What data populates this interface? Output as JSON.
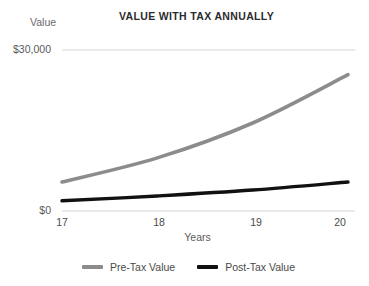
{
  "chart_data": {
    "type": "line",
    "title": "VALUE WITH TAX ANNUALLY",
    "xlabel": "Years",
    "ylabel": "Value",
    "x": [
      17,
      18,
      19,
      20
    ],
    "xtick_labels": [
      "17",
      "18",
      "19",
      "20"
    ],
    "ytick_labels": [
      "$0",
      "$30,000"
    ],
    "ylim": [
      0,
      30000
    ],
    "xlim": [
      17,
      20
    ],
    "grid": "horizontal-top-and-baseline-only",
    "legend_position": "bottom-center",
    "series": [
      {
        "name": "Pre-Tax Value",
        "color": "#8c8c8c",
        "values": [
          5400,
          9900,
          16400,
          25400
        ]
      },
      {
        "name": "Post-Tax Value",
        "color": "#111111",
        "values": [
          1900,
          2800,
          3900,
          5400
        ]
      }
    ]
  },
  "axis": {
    "y_label": "Value",
    "y_tick_top": "$30,000",
    "y_tick_bottom": "$0",
    "x_label": "Years",
    "x_ticks": [
      "17",
      "18",
      "19",
      "20"
    ]
  },
  "legend": {
    "items": [
      {
        "label": "Pre-Tax Value",
        "color": "#8c8c8c"
      },
      {
        "label": "Post-Tax Value",
        "color": "#111111"
      }
    ]
  },
  "colors": {
    "background": "#ffffff",
    "gridline": "#d6d6d6",
    "title_text": "#2b2b2b",
    "tick_text": "#5a5a5a",
    "pre_tax_line": "#8c8c8c",
    "post_tax_line": "#111111"
  }
}
